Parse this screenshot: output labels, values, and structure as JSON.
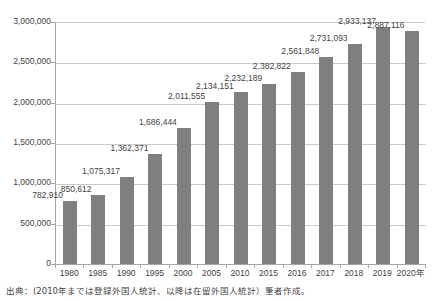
{
  "chart_data": {
    "type": "bar",
    "title": "",
    "subtitle": "",
    "xlabel": "",
    "ylabel": "",
    "categories": [
      "1980",
      "1985",
      "1990",
      "1995",
      "2000",
      "2005",
      "2010",
      "2015",
      "2016",
      "2017",
      "2018",
      "2019",
      "2020年"
    ],
    "values": [
      782910,
      850612,
      1075317,
      1362371,
      1686444,
      2011555,
      2134151,
      2232189,
      2382822,
      2561848,
      2731093,
      2933137,
      2887116
    ],
    "data_labels": [
      "782,910",
      "850,612",
      "1,075,317",
      "1,362,371",
      "1,686,444",
      "2,011,555",
      "2,134,151",
      "2,232,189",
      "2,382,822",
      "2,561,848",
      "2,731,093",
      "2,933,137",
      "2,887,116"
    ],
    "ylim": [
      0,
      3000000
    ],
    "ytick_values": [
      0,
      500000,
      1000000,
      1500000,
      2000000,
      2500000,
      3000000
    ],
    "ytick_labels": [
      "0",
      "500,000",
      "1,000,000",
      "1,500,000",
      "2,000,000",
      "2,500,000",
      "3,000,000"
    ],
    "grid": true,
    "legend": false,
    "legend_position": "none",
    "bar_color": "#7f7f7f",
    "gridline_color": "#c9c9c9",
    "axis_color": "#a6a6a6",
    "text_color": "#3f3f3f",
    "background_color": "#ffffff"
  },
  "footnote": {
    "text": "出典：(2010年までは登録外国人統計、以降は在留外国人統計）筆者作成。"
  }
}
